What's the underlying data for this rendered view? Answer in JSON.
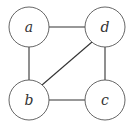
{
  "diagram": {
    "type": "undirected-graph",
    "nodes": [
      {
        "id": "a",
        "label": "a",
        "x": 29,
        "y": 27
      },
      {
        "id": "d",
        "label": "d",
        "x": 105,
        "y": 27
      },
      {
        "id": "b",
        "label": "b",
        "x": 29,
        "y": 100
      },
      {
        "id": "c",
        "label": "c",
        "x": 105,
        "y": 100
      }
    ],
    "edges": [
      [
        "a",
        "d"
      ],
      [
        "a",
        "b"
      ],
      [
        "b",
        "d"
      ],
      [
        "d",
        "c"
      ],
      [
        "b",
        "c"
      ]
    ],
    "node_radius": 20
  }
}
